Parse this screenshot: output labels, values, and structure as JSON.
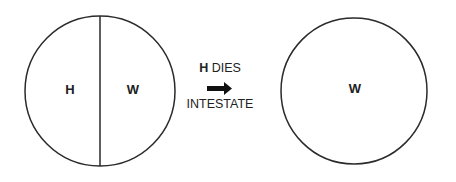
{
  "diagram": {
    "before": {
      "left_label": "H",
      "right_label": "W"
    },
    "transition": {
      "bold_prefix": "H",
      "line1_rest": " DIES",
      "line2": "INTESTATE",
      "arrow": "right-arrow"
    },
    "after": {
      "label": "W"
    },
    "colors": {
      "stroke": "#2a2a2a",
      "background": "#ffffff"
    }
  }
}
